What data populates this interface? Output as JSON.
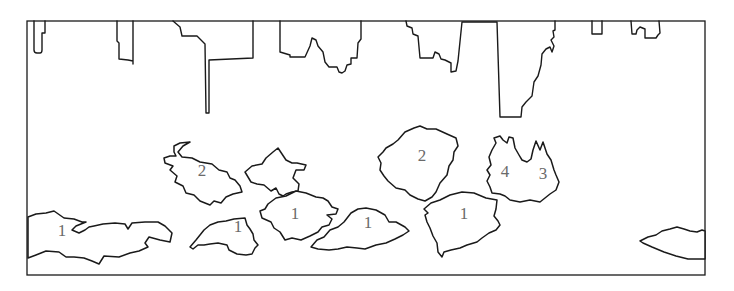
{
  "diagram": {
    "type": "region-outline-map",
    "frame": {
      "x": 27,
      "y": 21,
      "width": 678,
      "height": 254
    },
    "colors": {
      "stroke": "#1a1a1a",
      "background": "#ffffff",
      "label": "#6a6a6a"
    },
    "top_boundary_shapes": [
      {
        "id": "top-shape-1",
        "description": "small narrow notch at left"
      },
      {
        "id": "top-shape-2",
        "description": "narrow rectangular notch"
      },
      {
        "id": "top-shape-3",
        "description": "stepped shape with long vertical spike"
      },
      {
        "id": "top-shape-4",
        "description": "irregular shape with central peak"
      },
      {
        "id": "top-shape-5",
        "description": "stepped shape with deep rectangular drop"
      },
      {
        "id": "top-shape-6",
        "description": "small square notch"
      },
      {
        "id": "top-shape-7",
        "description": "small hooked notch"
      }
    ],
    "regions": [
      {
        "id": "region-a",
        "label": "2",
        "label_x": 202,
        "label_y": 172
      },
      {
        "id": "region-b",
        "label": "",
        "label_x": 280,
        "label_y": 172
      },
      {
        "id": "region-c",
        "label": "2",
        "label_x": 422,
        "label_y": 157
      },
      {
        "id": "region-d",
        "label": "4",
        "label_x": 505,
        "label_y": 173
      },
      {
        "id": "region-e",
        "label": "3",
        "label_x": 543,
        "label_y": 175
      },
      {
        "id": "region-f",
        "label": "1",
        "label_x": 62,
        "label_y": 232
      },
      {
        "id": "region-g",
        "label": "1",
        "label_x": 238,
        "label_y": 228
      },
      {
        "id": "region-h",
        "label": "1",
        "label_x": 295,
        "label_y": 215
      },
      {
        "id": "region-i",
        "label": "1",
        "label_x": 368,
        "label_y": 224
      },
      {
        "id": "region-j",
        "label": "1",
        "label_x": 464,
        "label_y": 215
      },
      {
        "id": "region-k",
        "label": "",
        "label_x": 680,
        "label_y": 240
      }
    ]
  }
}
